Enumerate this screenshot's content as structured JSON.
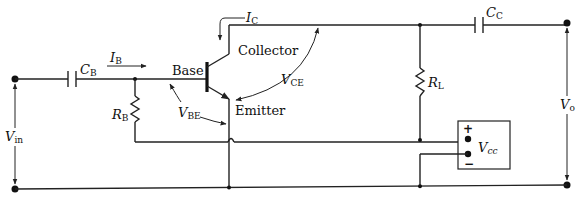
{
  "diagram": {
    "labels": {
      "cb_main": "C",
      "cb_sub": "B",
      "ib_main": "I",
      "ib_sub": "B",
      "base": "Base",
      "ic_main": "I",
      "ic_sub": "C",
      "collector": "Collector",
      "vce_main": "V",
      "vce_sub": "CE",
      "vbe_main": "V",
      "vbe_sub": "BE",
      "emitter": "Emitter",
      "rb_main": "R",
      "rb_sub": "B",
      "rl_main": "R",
      "rl_sub": "L",
      "cc_main": "C",
      "cc_sub": "C",
      "vcc_main": "V",
      "vcc_sub": "cc",
      "vin_main": "V",
      "vin_sub": "in",
      "vo_main": "V",
      "vo_sub": "o",
      "plus": "+",
      "minus": "−"
    },
    "components": [
      {
        "id": "CB",
        "type": "capacitor",
        "label": "C_B"
      },
      {
        "id": "RB",
        "type": "resistor",
        "label": "R_B"
      },
      {
        "id": "Q1",
        "type": "npn-transistor",
        "terminals": [
          "Base",
          "Collector",
          "Emitter"
        ]
      },
      {
        "id": "RL",
        "type": "resistor",
        "label": "R_L"
      },
      {
        "id": "CC",
        "type": "capacitor",
        "label": "C_C"
      },
      {
        "id": "VCC",
        "type": "dc-supply",
        "label": "V_cc",
        "polarity": [
          "+",
          "−"
        ]
      }
    ],
    "signals": [
      "I_B",
      "I_C",
      "V_BE",
      "V_CE",
      "V_in",
      "V_o"
    ],
    "colors": {
      "ink": "#222222",
      "background": "#ffffff"
    }
  }
}
